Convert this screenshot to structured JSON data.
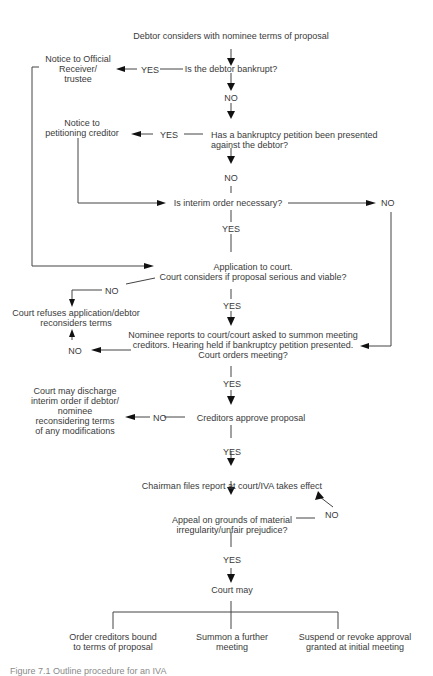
{
  "diagram": {
    "nodes": {
      "start": "Debtor considers with nominee terms of proposal",
      "q_bankrupt": "Is the debtor bankrupt?",
      "notice_or": [
        "Notice to Official",
        "Receiver/",
        "trustee"
      ],
      "q_petition": [
        "Has a bankruptcy petition been presented",
        "against the debtor?"
      ],
      "notice_pc": [
        "Notice to",
        "petitioning creditor"
      ],
      "q_interim": "Is interim order necessary?",
      "application": [
        "Application to court.",
        "Court considers if proposal serious and viable?"
      ],
      "court_refuses": [
        "Court refuses application/debtor",
        "reconsiders terms"
      ],
      "nominee_reports": [
        "Nominee reports to court/court asked to summon meeting",
        "creditors.  Hearing held if bankruptcy petition presented.",
        "Court orders meeting?"
      ],
      "discharge": [
        "Court may discharge",
        "interim order if debtor/",
        "nominee",
        "reconsidering terms",
        "of any modifications"
      ],
      "creditors_approve": "Creditors approve proposal",
      "chairman": "Chairman files report at court/IVA takes effect",
      "appeal": [
        "Appeal on grounds of material",
        "irregularity/unfair prejudice?"
      ],
      "court_may": "Court may",
      "outcome_1": [
        "Order creditors bound",
        "to terms of proposal"
      ],
      "outcome_2": [
        "Summon a further",
        "meeting"
      ],
      "outcome_3": [
        "Suspend or revoke approval",
        "granted at initial meeting"
      ]
    },
    "edge_labels": {
      "yes": "YES",
      "no": "NO"
    },
    "caption": "Figure 7.1  Outline procedure for an IVA"
  }
}
